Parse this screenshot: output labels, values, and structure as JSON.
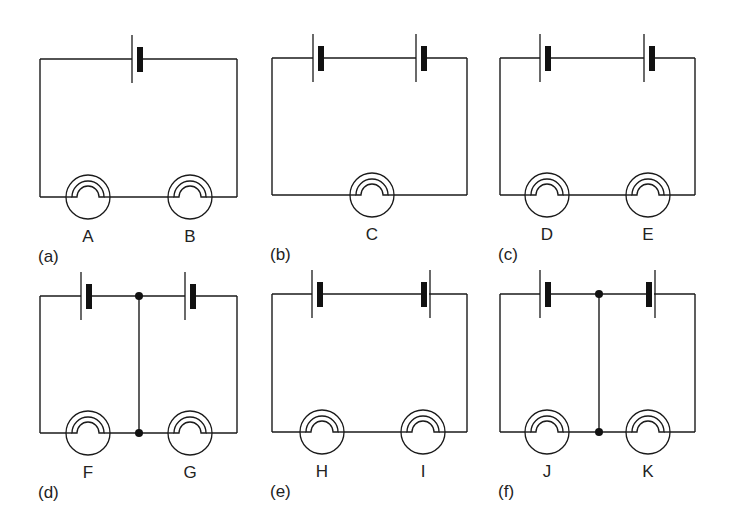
{
  "figure": {
    "colors": {
      "line": "#1a1a1a",
      "background": "#ffffff"
    },
    "circuits": [
      {
        "id": "a",
        "caption": "(a)",
        "box": {
          "left": 40,
          "right": 237,
          "top": 59,
          "bottom": 197
        },
        "cells": [
          {
            "x": 132,
            "orientation": "thin-left"
          }
        ],
        "lamps": [
          {
            "label": "A",
            "x": 88
          },
          {
            "label": "B",
            "x": 190
          }
        ],
        "junctions": []
      },
      {
        "id": "b",
        "caption": "(b)",
        "box": {
          "left": 272,
          "right": 467,
          "top": 58,
          "bottom": 195
        },
        "cells": [
          {
            "x": 313,
            "orientation": "thin-left"
          },
          {
            "x": 416,
            "orientation": "thin-left"
          }
        ],
        "lamps": [
          {
            "label": "C",
            "x": 372
          }
        ],
        "junctions": []
      },
      {
        "id": "c",
        "caption": "(c)",
        "box": {
          "left": 500,
          "right": 695,
          "top": 58,
          "bottom": 195
        },
        "cells": [
          {
            "x": 540,
            "orientation": "thin-left"
          },
          {
            "x": 644,
            "orientation": "thin-left"
          }
        ],
        "lamps": [
          {
            "label": "D",
            "x": 547
          },
          {
            "label": "E",
            "x": 648
          }
        ],
        "junctions": []
      },
      {
        "id": "d",
        "caption": "(d)",
        "box": {
          "left": 40,
          "right": 237,
          "top": 296,
          "bottom": 433
        },
        "cells": [
          {
            "x": 81,
            "orientation": "thin-left"
          },
          {
            "x": 185,
            "orientation": "thin-left"
          }
        ],
        "lamps": [
          {
            "label": "F",
            "x": 88
          },
          {
            "label": "G",
            "x": 190
          }
        ],
        "junctions": [
          {
            "x": 139
          }
        ]
      },
      {
        "id": "e",
        "caption": "(e)",
        "box": {
          "left": 272,
          "right": 467,
          "top": 294,
          "bottom": 432
        },
        "cells": [
          {
            "x": 312,
            "orientation": "thin-left"
          },
          {
            "x": 421,
            "orientation": "thick-left"
          }
        ],
        "lamps": [
          {
            "label": "H",
            "x": 322
          },
          {
            "label": "I",
            "x": 423
          }
        ],
        "junctions": []
      },
      {
        "id": "f",
        "caption": "(f)",
        "box": {
          "left": 500,
          "right": 695,
          "top": 294,
          "bottom": 432
        },
        "cells": [
          {
            "x": 540,
            "orientation": "thin-left"
          },
          {
            "x": 646,
            "orientation": "thick-left"
          }
        ],
        "lamps": [
          {
            "label": "J",
            "x": 547
          },
          {
            "label": "K",
            "x": 648
          }
        ],
        "junctions": [
          {
            "x": 599
          }
        ]
      }
    ]
  }
}
